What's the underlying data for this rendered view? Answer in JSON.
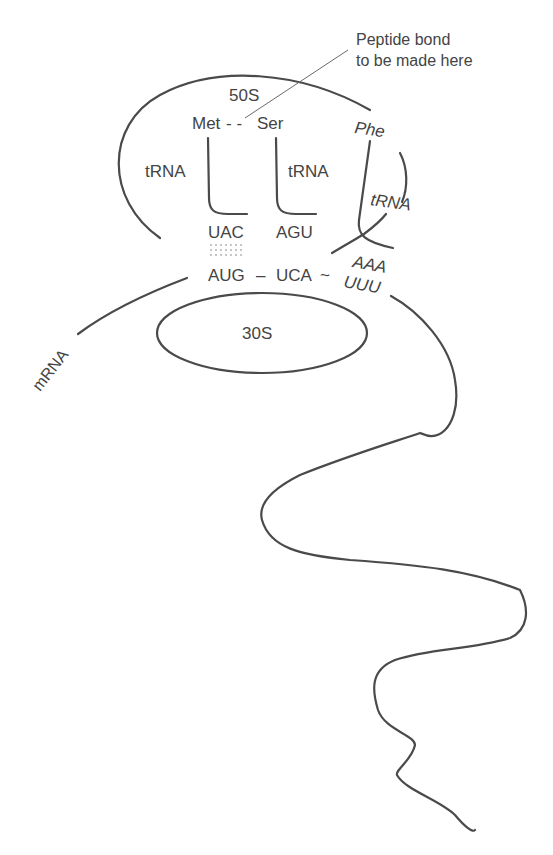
{
  "diagram": {
    "annotation": {
      "line1": "Peptide bond",
      "line2": "to be made here"
    },
    "large_subunit": {
      "label": "50S"
    },
    "small_subunit": {
      "label": "30S"
    },
    "amino_acids": {
      "first": "Met",
      "second": "Ser",
      "third": "Phe",
      "bond": "- -"
    },
    "trnas": [
      {
        "label": "tRNA",
        "anticodon": "UAC"
      },
      {
        "label": "tRNA",
        "anticodon": "AGU"
      },
      {
        "label": "tRNA",
        "anticodon": "AAA"
      }
    ],
    "mrna": {
      "label": "mRNA",
      "codons": [
        "AUG",
        "UCA",
        "UUU"
      ],
      "sep1": "–",
      "sep2": "~"
    },
    "colors": {
      "line": "#4a4a4a",
      "text": "#444444",
      "background": "#ffffff"
    }
  }
}
